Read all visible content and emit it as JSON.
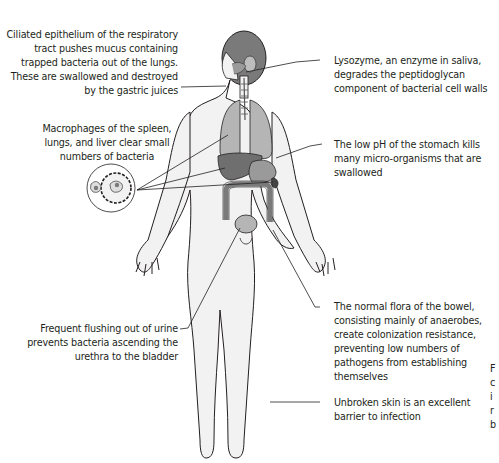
{
  "diagram": {
    "colors": {
      "skin_fill": "#f2f2f2",
      "outline": "#231f20",
      "organ_light": "#b5b5b5",
      "organ_mid": "#9a9a9a",
      "organ_dark": "#6f6f6f",
      "hair": "#7a7a7a",
      "leader_line": "#231f20"
    },
    "annotations": [
      {
        "id": "respiratory",
        "text": "Ciliated epithelium of the respiratory\ntract pushes mucus containing\ntrapped bacteria out of the lungs.\nThese are swallowed and destroyed\nby the gastric juices",
        "points_to": "trachea / throat"
      },
      {
        "id": "lysozyme",
        "text": "Lysozyme, an enzyme in saliva,\ndegrades the peptidoglycan\ncomponent of bacterial cell walls",
        "points_to": "mouth"
      },
      {
        "id": "macrophages",
        "text": "Macrophages of the spleen,\nlungs, and liver clear small\nnumbers of bacteria",
        "points_to": "lungs, liver, spleen"
      },
      {
        "id": "stomach",
        "text": "The low pH of the stomach kills\nmany micro-organisms that are\nswallowed",
        "points_to": "stomach"
      },
      {
        "id": "bowel",
        "text": "The normal flora of the bowel,\nconsisting mainly of anaerobes,\ncreate colonization resistance,\npreventing low numbers of\npathogens from establishing\nthemselves",
        "points_to": "large intestine"
      },
      {
        "id": "urine",
        "text": "Frequent flushing out of urine\nprevents bacteria ascending the\nurethra to the bladder",
        "points_to": "bladder"
      },
      {
        "id": "skin",
        "text": "Unbroken skin is an excellent\nbarrier to infection",
        "points_to": "leg skin"
      }
    ],
    "clipped_right_edge_text": [
      "F",
      "c",
      "i",
      "r",
      "b"
    ],
    "inset": {
      "name": "macrophage engulfing bacterium",
      "shape": "circle"
    }
  }
}
